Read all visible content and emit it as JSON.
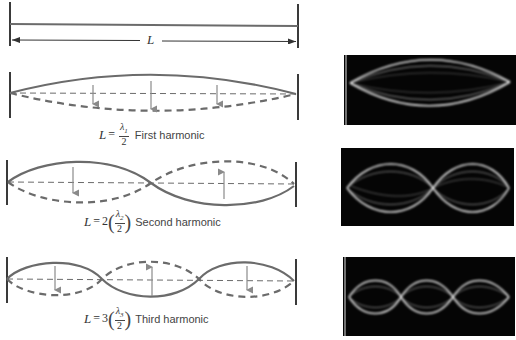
{
  "top": {
    "length_label": "L"
  },
  "harmonics": [
    {
      "n": "1",
      "coefficient": "",
      "lambda": "λ",
      "subscript": "1",
      "denominator": "2",
      "lhs": "L",
      "equals": "=",
      "name": "First harmonic",
      "nodes": 0
    },
    {
      "n": "2",
      "coefficient": "2",
      "lambda": "λ",
      "subscript": "2",
      "denominator": "2",
      "lhs": "L",
      "equals": "=",
      "name": "Second harmonic",
      "nodes": 1
    },
    {
      "n": "3",
      "coefficient": "3",
      "lambda": "λ",
      "subscript": "3",
      "denominator": "2",
      "lhs": "L",
      "equals": "=",
      "name": "Third harmonic",
      "nodes": 2
    }
  ],
  "photos": [
    {
      "label": "first-harmonic-photo",
      "loops": 1
    },
    {
      "label": "second-harmonic-photo",
      "loops": 2
    },
    {
      "label": "third-harmonic-photo",
      "loops": 3
    }
  ],
  "colors": {
    "line": "#6b6b6b",
    "arrow": "#8a8a8a",
    "wall": "#3a3a3a",
    "photo_bg": "#050505",
    "photo_glow": "#e8e8e8"
  }
}
